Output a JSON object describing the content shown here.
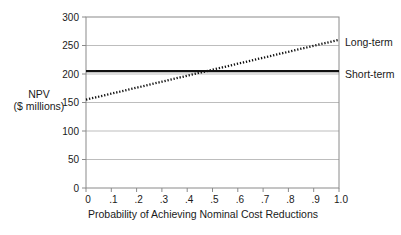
{
  "figure": {
    "background": "#ffffff",
    "y_axis_label_line1": "NPV",
    "y_axis_label_line2": "($ millions)",
    "x_axis_label": "Probability of Achieving Nominal Cost Reductions"
  },
  "chart_data": {
    "type": "line",
    "title": "",
    "xlabel": "Probability of Achieving Nominal Cost Reductions",
    "ylabel": "NPV ($ millions)",
    "xlim": [
      0,
      1.0
    ],
    "ylim": [
      0,
      300
    ],
    "grid": "horizontal",
    "legend_position": "right-of-line-ends",
    "xticks": {
      "values": [
        0,
        0.1,
        0.2,
        0.3,
        0.4,
        0.5,
        0.6,
        0.7,
        0.8,
        0.9,
        1.0
      ],
      "labels": [
        "0",
        ".1",
        ".2",
        ".3",
        ".4",
        ".5",
        ".6",
        ".7",
        ".8",
        ".9",
        "1.0"
      ]
    },
    "yticks": {
      "values": [
        0,
        50,
        100,
        150,
        200,
        250,
        300
      ],
      "labels": [
        "0",
        "50",
        "100",
        "150",
        "200",
        "250",
        "300"
      ]
    },
    "series": [
      {
        "name": "Long-term",
        "line_style": "dotted",
        "color": "#111111",
        "x": [
          0,
          0.1,
          0.2,
          0.3,
          0.4,
          0.5,
          0.6,
          0.7,
          0.8,
          0.9,
          1.0
        ],
        "values": [
          155,
          165.5,
          176,
          186.5,
          197,
          207.5,
          218,
          228.5,
          239,
          249.5,
          260
        ]
      },
      {
        "name": "Short-term",
        "line_style": "solid",
        "color": "#111111",
        "x": [
          0,
          1.0
        ],
        "values": [
          205,
          205
        ]
      }
    ]
  },
  "colors": {
    "grid": "#b5b5b5",
    "axis": "#8a8a8a",
    "text": "#1a1a1a",
    "line": "#111111"
  }
}
